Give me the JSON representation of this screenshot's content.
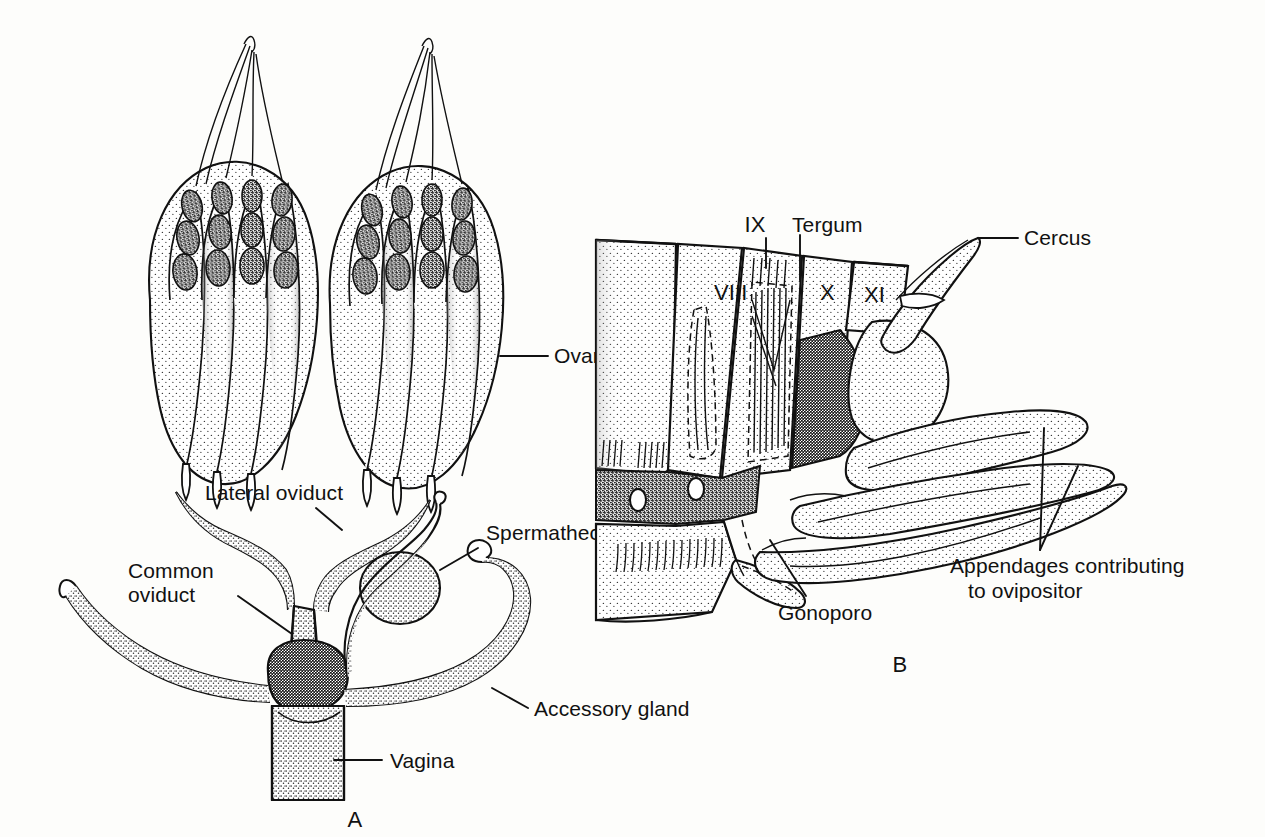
{
  "figure": {
    "background_color": "#fdfdfb",
    "ink_color": "#111111",
    "panels": [
      {
        "id": "A",
        "caption": "A",
        "subject": "Internal female reproductive system"
      },
      {
        "id": "B",
        "caption": "B",
        "subject": "Lateral view of terminal abdominal segments with ovipositor"
      }
    ]
  },
  "panel_a": {
    "caption": "A",
    "labels": {
      "ovary": "Ovary",
      "lateral_oviduct": "Lateral oviduct",
      "common_oviduct": "Common oviduct",
      "spermatheca": "Spermatheca",
      "accessory_gland": "Accessory gland",
      "vagina": "Vagina"
    },
    "structure": {
      "ovary_count": 2,
      "ovarioles_per_ovary": 5,
      "terminal_filament": "present",
      "spermatheca_shape": "ovoid with coiled duct",
      "accessory_glands": 2
    }
  },
  "panel_b": {
    "caption": "B",
    "labels": {
      "tergum": "Tergum",
      "cercus": "Cercus",
      "gonoporo": "Gonoporo",
      "appendages": "Appendages contributing to ovipositor"
    },
    "segments": [
      "VIII",
      "IX",
      "X",
      "XI"
    ],
    "structure": {
      "spiracles": 2,
      "ovipositor_valves": 3,
      "apodemes": "dashed internal outlines",
      "intersegmental_membrane": "stippled"
    }
  }
}
